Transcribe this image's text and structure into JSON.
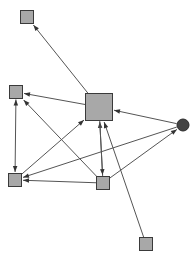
{
  "diagram": {
    "type": "node-link-diagram",
    "background_color": "#ffffff",
    "canvas": {
      "width": 196,
      "height": 261
    }
  },
  "style": {
    "square_fill": "#a8a8a8",
    "square_stroke": "#3a3a3a",
    "circle_fill": "#444444",
    "circle_stroke": "#2b2b2b",
    "edge_color": "#555555",
    "arrowhead_color": "#333333",
    "edge_width": 1,
    "arrowhead_length": 6,
    "arrowhead_width": 4.5
  },
  "nodes": [
    {
      "id": "n1",
      "name": "node-top-left",
      "shape": "square",
      "cx": 27,
      "cy": 17,
      "size": 13
    },
    {
      "id": "n2",
      "name": "node-left-middle",
      "shape": "square",
      "cx": 16,
      "cy": 92,
      "size": 13
    },
    {
      "id": "n3",
      "name": "node-left-bottom",
      "shape": "square",
      "cx": 15,
      "cy": 180,
      "size": 13
    },
    {
      "id": "n4",
      "name": "node-center-hub",
      "shape": "square",
      "cx": 99,
      "cy": 107,
      "size": 27
    },
    {
      "id": "n5",
      "name": "node-bottom-middle",
      "shape": "square",
      "cx": 103,
      "cy": 183,
      "size": 13
    },
    {
      "id": "n6",
      "name": "node-right-circle",
      "shape": "circle",
      "cx": 183,
      "cy": 125,
      "size": 12
    },
    {
      "id": "n7",
      "name": "node-bottom-right",
      "shape": "square",
      "cx": 146,
      "cy": 244,
      "size": 13
    }
  ],
  "edges": [
    {
      "from": "n4",
      "to": "n1",
      "name": "edge-hub-to-top-left",
      "directed": true
    },
    {
      "from": "n4",
      "to": "n2",
      "name": "edge-hub-to-left-middle",
      "directed": true
    },
    {
      "from": "n2",
      "to": "n3",
      "name": "edge-left-middle-left-bottom",
      "directed": true,
      "bidirectional": true
    },
    {
      "from": "n5",
      "to": "n2",
      "name": "edge-bottom-middle-to-left-middle",
      "directed": true
    },
    {
      "from": "n5",
      "to": "n3",
      "name": "edge-bottom-middle-to-left-bottom",
      "directed": true
    },
    {
      "from": "n3",
      "to": "n4",
      "name": "edge-left-bottom-to-hub",
      "directed": true
    },
    {
      "from": "n6",
      "to": "n4",
      "name": "edge-circle-to-hub",
      "directed": true
    },
    {
      "from": "n5",
      "to": "n4",
      "name": "edge-bottom-middle-to-hub",
      "directed": true
    },
    {
      "from": "n4",
      "to": "n5",
      "name": "edge-hub-to-bottom-middle",
      "directed": true
    },
    {
      "from": "n7",
      "to": "n4",
      "name": "edge-bottom-right-to-hub",
      "directed": true
    },
    {
      "from": "n5",
      "to": "n6",
      "name": "edge-bottom-middle-to-circle",
      "directed": true
    },
    {
      "from": "n6",
      "to": "n3",
      "name": "edge-circle-to-left-bottom",
      "directed": true
    }
  ]
}
